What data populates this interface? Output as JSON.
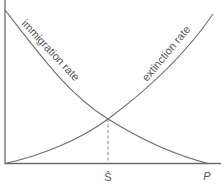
{
  "diagram": {
    "title": "",
    "curves": [
      {
        "name": "immigration rate",
        "label": "immigration rate",
        "trend": "decreasing"
      },
      {
        "name": "extinction rate",
        "label": "extinction rate",
        "trend": "increasing"
      }
    ],
    "x_axis": {
      "labels": [
        {
          "id": "equilibrium",
          "text": "Ŝ"
        },
        {
          "id": "pool",
          "text": "P"
        }
      ]
    },
    "colors": {
      "line": "#6e6e6e",
      "text": "#555555",
      "background": "#ffffff"
    }
  }
}
